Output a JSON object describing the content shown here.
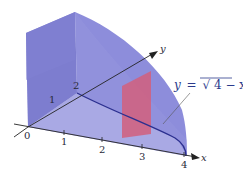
{
  "figure": {
    "colors": {
      "solid_left_face": "#6f6fc4",
      "solid_top_face": "#8686d8",
      "solid_base": "#9d9de0",
      "solid_curved_face": "#8e8edb",
      "cross_section": "#d1607a",
      "curve": "#2b2f8f",
      "axis": "#222222",
      "equation_text": "#2b3a8c"
    },
    "axes": {
      "x": {
        "label": "x",
        "ticks": [
          "0",
          "1",
          "2",
          "3",
          "4"
        ]
      },
      "y": {
        "label": "y",
        "ticks": [
          "1",
          "2"
        ]
      }
    },
    "equation": {
      "lhs": "y",
      "equals": "=",
      "radical": "√",
      "radicand": "4 − x",
      "full": "y = √(4 − x)"
    }
  }
}
